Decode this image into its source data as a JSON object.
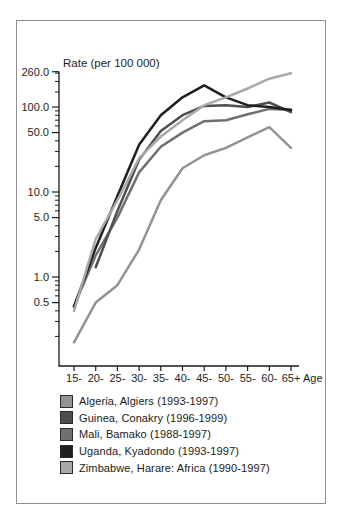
{
  "figure": {
    "y_axis_title": "Rate (per 100 000)",
    "x_axis_suffix": "Age"
  },
  "chart_data": {
    "type": "line",
    "y_scale": "log",
    "title": "",
    "xlabel": "Age",
    "ylabel": "Rate (per 100 000)",
    "legend_position": "bottom",
    "grid": false,
    "ylim": [
      0.09,
      260
    ],
    "categories": [
      "15-",
      "20-",
      "25-",
      "30-",
      "35-",
      "40-",
      "45-",
      "50-",
      "55-",
      "60-",
      "65+"
    ],
    "y_tick_labels": [
      "260.0",
      "100.0",
      "50.0",
      "10.0",
      "5.0",
      "1.0",
      "0.5"
    ],
    "y_major_ticks": [
      260,
      100,
      50,
      10,
      5,
      1,
      0.5
    ],
    "y_minor_ticks": [
      0.2,
      0.3,
      0.4,
      0.6,
      0.7,
      0.8,
      0.9,
      2,
      3,
      4,
      6,
      7,
      8,
      9,
      20,
      30,
      40,
      60,
      70,
      80,
      90,
      150,
      200,
      250
    ],
    "series": [
      {
        "name": "Algeria, Algiers (1993-1997)",
        "color": "#939393",
        "values": [
          0.17,
          0.5,
          0.8,
          2.1,
          8,
          19,
          27,
          33,
          44,
          58,
          33
        ]
      },
      {
        "name": "Guinea, Conakry (1996-1999)",
        "color": "#4f4f4f",
        "values": [
          null,
          1.3,
          6,
          24,
          52,
          80,
          103,
          105,
          100,
          113,
          87
        ]
      },
      {
        "name": "Mali, Bamako (1988-1997)",
        "color": "#707070",
        "values": [
          0.45,
          1.8,
          5,
          17,
          34,
          50,
          68,
          70,
          82,
          95,
          93
        ]
      },
      {
        "name": "Uganda, Kyadondo (1993-1997)",
        "color": "#1f1f1f",
        "values": [
          0.45,
          2.2,
          9,
          36,
          80,
          130,
          180,
          130,
          105,
          100,
          92
        ]
      },
      {
        "name": "Zimbabwe, Harare: Africa (1990-1997)",
        "color": "#a9a9a9",
        "values": [
          0.4,
          2.8,
          8,
          25,
          45,
          70,
          105,
          130,
          165,
          215,
          250
        ]
      }
    ]
  }
}
